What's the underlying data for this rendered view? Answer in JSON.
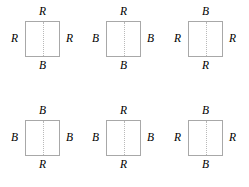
{
  "figures": [
    {
      "id": "figure-1",
      "top": "R",
      "left": "R",
      "right": "R",
      "bottom": "B"
    },
    {
      "id": "figure-2",
      "top": "R",
      "left": "B",
      "right": "B",
      "bottom": "B"
    },
    {
      "id": "figure-3",
      "top": "B",
      "left": "R",
      "right": "R",
      "bottom": "R"
    },
    {
      "id": "figure-4",
      "top": "B",
      "left": "B",
      "right": "B",
      "bottom": "R"
    },
    {
      "id": "figure-5",
      "top": "R",
      "left": "B",
      "right": "B",
      "bottom": "R"
    },
    {
      "id": "figure-6",
      "top": "B",
      "left": "R",
      "right": "R",
      "bottom": "B"
    }
  ],
  "style": {
    "border_color": "#a8a8a8",
    "midline_color": "#b9b9b9",
    "label_color": "#000000",
    "background": "#ffffff"
  }
}
